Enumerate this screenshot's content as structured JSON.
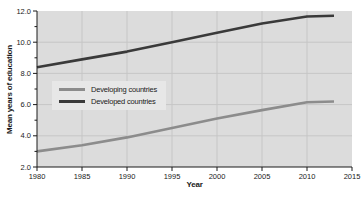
{
  "chart_data": {
    "type": "line",
    "title": "",
    "xlabel": "Year",
    "ylabel": "Mean years of education",
    "xlim": [
      1980,
      2015
    ],
    "ylim": [
      2.0,
      12.0
    ],
    "x_ticks": [
      1980,
      1985,
      1990,
      1995,
      2000,
      2005,
      2010,
      2015
    ],
    "x_tick_labels": [
      "1980",
      "1985",
      "1990",
      "1995",
      "2000",
      "2005",
      "2010",
      "2015"
    ],
    "y_ticks": [
      2.0,
      4.0,
      6.0,
      8.0,
      10.0,
      12.0
    ],
    "y_tick_labels": [
      "2.0",
      "4.0",
      "6.0",
      "8.0",
      "10.0",
      "12.0"
    ],
    "y_minor_ticks": [
      3.0,
      5.0,
      7.0,
      9.0,
      11.0
    ],
    "grid": true,
    "legend_position": "upper-left-inside-plot",
    "x": [
      1980,
      1985,
      1990,
      1995,
      2000,
      2005,
      2010,
      2013
    ],
    "series": [
      {
        "name": "Developing countries",
        "color": "#8c8c8c",
        "values": [
          3.0,
          3.4,
          3.9,
          4.5,
          5.1,
          5.65,
          6.15,
          6.2
        ]
      },
      {
        "name": "Developed countries",
        "color": "#3a3a3a",
        "values": [
          8.4,
          8.9,
          9.4,
          10.0,
          10.6,
          11.2,
          11.65,
          11.7
        ]
      }
    ],
    "colors": {
      "plot_background": "#dcdcdc",
      "gridline": "#c6c6c6",
      "axis": "#1a1a1a",
      "tick_text": "#1a1a1a",
      "legend_background": "#e7e7e7"
    }
  }
}
